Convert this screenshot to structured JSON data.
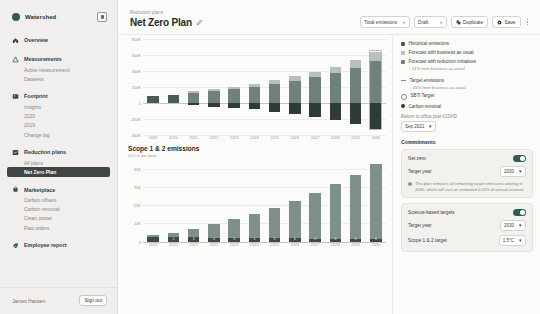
{
  "sidebar": {
    "brand": "Watershed",
    "collapse_icon": "collapse-panel-icon",
    "groups": [
      {
        "label": "Overview",
        "icon": "home-icon",
        "items": []
      },
      {
        "label": "Measurements",
        "icon": "measure-icon",
        "items": [
          "Active measurement",
          "Datasets"
        ]
      },
      {
        "label": "Footprint",
        "icon": "footprint-icon",
        "items": [
          "Insights",
          "2020",
          "2019",
          "Change log"
        ]
      },
      {
        "label": "Reduction plans",
        "icon": "reduction-icon",
        "items": [
          "All plans",
          "Net Zero Plan"
        ],
        "active_item": "Net Zero Plan"
      },
      {
        "label": "Marketplace",
        "icon": "marketplace-icon",
        "items": [
          "Carbon offsets",
          "Carbon removal",
          "Clean power",
          "Past orders"
        ]
      },
      {
        "label": "Employee report",
        "icon": "leaf-icon",
        "items": []
      }
    ],
    "user": "James Hansen",
    "sign_out": "Sign out"
  },
  "header": {
    "breadcrumb": "Reduction plans",
    "title": "Net Zero Plan",
    "edit_icon": "pencil-icon",
    "toolbar": {
      "metric_select": "Total emissions",
      "status_select": "Draft",
      "duplicate_label": "Duplicate",
      "duplicate_icon": "copy-icon",
      "save_label": "Save",
      "save_icon": "save-icon",
      "more_icon": "kebab-menu-icon"
    }
  },
  "legend": {
    "items": [
      {
        "label": "Historical emissions",
        "swatch": "#4a5a55",
        "type": "square"
      },
      {
        "label": "Forecast with business as usual",
        "swatch": "#b9bfbb",
        "type": "square"
      },
      {
        "label": "Forecast with reduction initiatives",
        "swatch": "#6f817a",
        "type": "square",
        "sub": "↓ 14% from business-as-usual"
      },
      {
        "label": "Target emissions",
        "swatch": "#8d8a85",
        "type": "line",
        "sub": "↓ 45% from business-as-usual"
      },
      {
        "label": "SBTi Target",
        "swatch": "transparent",
        "type": "ring"
      },
      {
        "label": "Carbon removal",
        "swatch": "#2f3b37",
        "type": "square"
      }
    ],
    "rto_label": "Return to office post-COVID",
    "rto_value": "Sep 2021",
    "commitments_title": "Commitments",
    "net_zero_card": {
      "toggle_label": "Net zero",
      "toggle_on": true,
      "target_year_label": "Target year",
      "target_year_value": "2030",
      "note": "This plan removes all remaining target emissions abating in 2030, which will cost an estimated 0.05% of annual revenue."
    },
    "sbt_card": {
      "toggle_label": "Science-based targets",
      "toggle_on": true,
      "target_year_label": "Target year",
      "target_year_value": "2030",
      "scope_label": "Scope 1 & 2 target",
      "scope_value": "1.5°C"
    }
  },
  "chart_data": [
    {
      "type": "bar",
      "id": "total-emissions",
      "title": "",
      "xlabel": "",
      "ylabel": "",
      "ylim": [
        -400000,
        800000
      ],
      "yticks": [
        800000,
        600000,
        400000,
        200000,
        0,
        -200000,
        -400000
      ],
      "ytick_labels": [
        "800K",
        "600K",
        "400K",
        "200K",
        "0",
        "-200K",
        "-400K"
      ],
      "categories": [
        "2019",
        "2020",
        "2021",
        "2022",
        "2023",
        "2024",
        "2025",
        "2026",
        "2027",
        "2028",
        "2029",
        "2030"
      ],
      "stacked": true,
      "series": [
        {
          "name": "Historical emissions",
          "color": "#4a5a55",
          "values": [
            90000,
            105000,
            0,
            0,
            0,
            0,
            0,
            0,
            0,
            0,
            0,
            0
          ]
        },
        {
          "name": "Forecast with reduction initiatives",
          "color": "#6f817a",
          "values": [
            0,
            0,
            130000,
            150000,
            175000,
            205000,
            240000,
            280000,
            320000,
            375000,
            440000,
            520000
          ]
        },
        {
          "name": "Forecast with business as usual",
          "color": "#b9bfbb",
          "values": [
            0,
            0,
            20000,
            25000,
            30000,
            35000,
            45000,
            55000,
            65000,
            80000,
            95000,
            120000
          ]
        },
        {
          "name": "Carbon removal",
          "color": "#2f3b37",
          "values": [
            0,
            0,
            -30000,
            -45000,
            -60000,
            -80000,
            -110000,
            -140000,
            -175000,
            -215000,
            -265000,
            -320000
          ]
        }
      ],
      "grid": true,
      "legend_position": "right"
    },
    {
      "type": "bar",
      "id": "scope-1-2-emissions",
      "title": "Scope 1 & 2 emissions",
      "subtitle": "tCO₂e per year",
      "xlabel": "",
      "ylabel": "",
      "ylim": [
        0,
        45000
      ],
      "yticks": [
        40000,
        30000,
        20000,
        10000,
        0
      ],
      "ytick_labels": [
        "40K",
        "30K",
        "20K",
        "10K",
        "0"
      ],
      "categories": [
        "2019",
        "2020",
        "2021",
        "2022",
        "2023",
        "2024",
        "2025",
        "2026",
        "2027",
        "2028",
        "2029",
        "2030"
      ],
      "stacked": true,
      "series": [
        {
          "name": "Base",
          "color": "#3e4a46",
          "values": [
            2600,
            2600,
            2400,
            2200,
            2000,
            1900,
            1800,
            1700,
            1600,
            1500,
            1400,
            1300
          ]
        },
        {
          "name": "Growth",
          "color": "#7f908a",
          "values": [
            900,
            2200,
            4600,
            7200,
            10200,
            13200,
            16800,
            20600,
            25000,
            29800,
            35200,
            41000
          ]
        }
      ],
      "bar_labels": [
        "",
        "2",
        "3",
        "4",
        "5",
        "5",
        "6",
        "6",
        "6",
        "6",
        "6",
        "6"
      ],
      "grid": true
    }
  ]
}
